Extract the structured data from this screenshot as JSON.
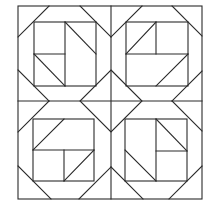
{
  "diagram": {
    "type": "quilt-block-pattern",
    "stroke_color": "#2a2a2a",
    "background": "#ffffff",
    "outer_border": {
      "x1": 18,
      "y1": 6,
      "x2": 202,
      "y2": 199
    },
    "center_lines": [
      {
        "x1": 111,
        "y1": 6,
        "x2": 111,
        "y2": 199
      },
      {
        "x1": 18,
        "y1": 101,
        "x2": 202,
        "y2": 101
      }
    ],
    "center_diamond": [
      [
        111,
        70
      ],
      [
        142,
        101
      ],
      [
        111,
        132
      ],
      [
        80,
        101
      ]
    ],
    "blocks": [
      {
        "name": "top-left",
        "inner_square": [
          34,
          22,
          96,
          86
        ],
        "corner_cuts": [
          [
            49,
            6,
            18,
            37
          ],
          [
            80,
            6,
            111,
            37
          ],
          [
            18,
            70,
            49,
            101
          ]
        ],
        "inner_lines": [
          [
            65,
            22,
            65,
            86
          ],
          [
            34,
            54,
            65,
            54
          ],
          [
            65,
            22,
            96,
            54
          ],
          [
            34,
            54,
            65,
            86
          ]
        ]
      },
      {
        "name": "top-right",
        "inner_square": [
          126,
          22,
          188,
          86
        ],
        "corner_cuts": [
          [
            142,
            6,
            111,
            37
          ],
          [
            172,
            6,
            202,
            36
          ],
          [
            202,
            71,
            172,
            101
          ]
        ],
        "inner_lines": [
          [
            156,
            22,
            156,
            54
          ],
          [
            126,
            54,
            188,
            54
          ],
          [
            156,
            22,
            126,
            54
          ],
          [
            188,
            54,
            156,
            86
          ]
        ]
      },
      {
        "name": "bottom-left",
        "inner_square": [
          33,
          119,
          94,
          181
        ],
        "corner_cuts": [
          [
            49,
            101,
            18,
            132
          ],
          [
            18,
            166,
            51,
            199
          ],
          [
            79,
            199,
            111,
            167
          ]
        ],
        "inner_lines": [
          [
            33,
            150,
            94,
            150
          ],
          [
            64,
            119,
            33,
            150
          ],
          [
            64,
            150,
            64,
            181
          ],
          [
            94,
            150,
            64,
            181
          ]
        ]
      },
      {
        "name": "bottom-right",
        "inner_square": [
          125,
          119,
          187,
          181
        ],
        "corner_cuts": [
          [
            172,
            101,
            202,
            131
          ],
          [
            111,
            167,
            143,
            199
          ],
          [
            202,
            166,
            169,
            199
          ]
        ],
        "inner_lines": [
          [
            156,
            119,
            156,
            181
          ],
          [
            156,
            151,
            187,
            151
          ],
          [
            156,
            119,
            187,
            151
          ],
          [
            125,
            150,
            156,
            181
          ]
        ]
      }
    ]
  }
}
